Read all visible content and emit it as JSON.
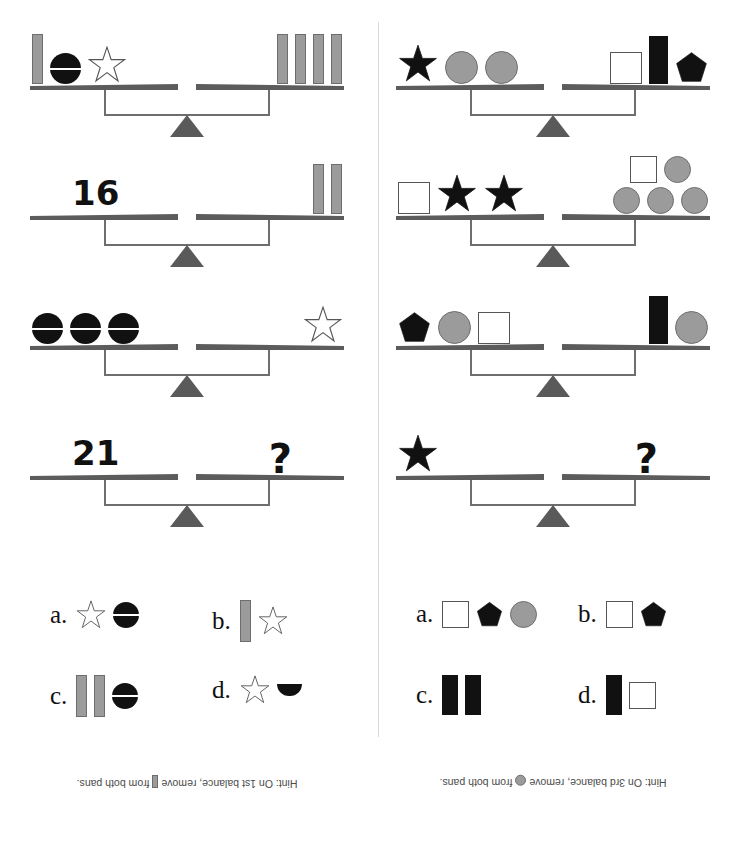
{
  "layout": {
    "width": 748,
    "height": 842,
    "divider_color": "#d9d9d9",
    "panels": 2
  },
  "colors": {
    "bar_gray": "#9b9b9b",
    "bar_gray_outline": "#6d6d6d",
    "black": "#111111",
    "pan_gray": "#5c5c5c",
    "fulcrum_gray": "#5a5a5a",
    "beam_gray": "#6e6e6e",
    "white_fill": "#ffffff",
    "outline": "#555555",
    "hint_text": "#4a4a4a"
  },
  "puzzles": [
    {
      "id": "puzzle-left",
      "balances": [
        {
          "index": 1,
          "left": {
            "type": "shapes",
            "items": [
              "bar-gray",
              "circle-split-black",
              "star-outline"
            ]
          },
          "right": {
            "type": "shapes",
            "items": [
              "bar-gray",
              "bar-gray",
              "bar-gray",
              "bar-gray"
            ]
          }
        },
        {
          "index": 2,
          "left": {
            "type": "number",
            "value": "16"
          },
          "right": {
            "type": "shapes",
            "items": [
              "bar-gray",
              "bar-gray"
            ]
          }
        },
        {
          "index": 3,
          "left": {
            "type": "shapes",
            "items": [
              "circle-split-black",
              "circle-split-black",
              "circle-split-black"
            ]
          },
          "right": {
            "type": "shapes",
            "items": [
              "star-outline"
            ]
          }
        },
        {
          "index": 4,
          "left": {
            "type": "number",
            "value": "21"
          },
          "right": {
            "type": "question",
            "value": "?"
          }
        }
      ],
      "choices": [
        {
          "letter": "a.",
          "items": [
            "star-outline",
            "circle-split-black"
          ]
        },
        {
          "letter": "b.",
          "items": [
            "bar-gray",
            "star-outline"
          ]
        },
        {
          "letter": "c.",
          "items": [
            "bar-gray",
            "bar-gray",
            "circle-split-black"
          ]
        },
        {
          "letter": "d.",
          "items": [
            "star-outline",
            "half-circle-black"
          ]
        }
      ],
      "hint": {
        "prefix": "Hint:  On 1st balance, remove",
        "shape": "bar-gray",
        "suffix": "from both pans."
      }
    },
    {
      "id": "puzzle-right",
      "balances": [
        {
          "index": 1,
          "left": {
            "type": "shapes",
            "items": [
              "star-black",
              "circle-gray",
              "circle-gray"
            ]
          },
          "right": {
            "type": "shapes",
            "items": [
              "square-white",
              "bar-black",
              "pentagon-black"
            ]
          }
        },
        {
          "index": 2,
          "left": {
            "type": "shapes",
            "items": [
              "square-white",
              "star-black",
              "star-black"
            ]
          },
          "right": {
            "type": "stack",
            "rows": [
              [
                "square-white",
                "circle-gray"
              ],
              [
                "circle-gray",
                "circle-gray",
                "circle-gray"
              ]
            ]
          }
        },
        {
          "index": 3,
          "left": {
            "type": "shapes",
            "items": [
              "pentagon-black",
              "circle-gray",
              "square-white"
            ]
          },
          "right": {
            "type": "shapes",
            "items": [
              "bar-black",
              "circle-gray"
            ]
          }
        },
        {
          "index": 4,
          "left": {
            "type": "shapes",
            "items": [
              "star-black"
            ]
          },
          "right": {
            "type": "question",
            "value": "?"
          }
        }
      ],
      "choices": [
        {
          "letter": "a.",
          "items": [
            "square-white",
            "pentagon-black",
            "circle-gray"
          ]
        },
        {
          "letter": "b.",
          "items": [
            "square-white",
            "pentagon-black"
          ]
        },
        {
          "letter": "c.",
          "items": [
            "bar-black",
            "bar-black"
          ]
        },
        {
          "letter": "d.",
          "items": [
            "bar-black",
            "square-white"
          ]
        }
      ],
      "hint": {
        "prefix": "Hint:  On 3rd balance, remove",
        "shape": "circle-gray",
        "suffix": "from both pans."
      }
    }
  ]
}
